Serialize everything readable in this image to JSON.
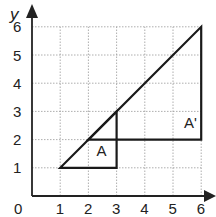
{
  "chart_data": {
    "type": "diagram",
    "title": "",
    "xlabel": "x",
    "ylabel": "y",
    "xlim": [
      0,
      6
    ],
    "ylim": [
      0,
      6
    ],
    "origin_label": "0",
    "x_ticks": [
      "1",
      "2",
      "3",
      "4",
      "5",
      "6"
    ],
    "y_ticks": [
      "1",
      "2",
      "3",
      "4",
      "5",
      "6"
    ],
    "grid": true,
    "shapes": [
      {
        "name": "A",
        "label": "A",
        "vertices": [
          [
            1,
            1
          ],
          [
            3,
            1
          ],
          [
            3,
            3
          ]
        ],
        "label_pos": [
          2.5,
          1.6
        ]
      },
      {
        "name": "A'",
        "label": "A'",
        "vertices": [
          [
            2,
            2
          ],
          [
            6,
            2
          ],
          [
            6,
            6
          ]
        ],
        "label_pos": [
          5.6,
          2.6
        ]
      }
    ]
  },
  "labels": {
    "A": "A",
    "A_prime": "A'",
    "x": "x",
    "y": "y",
    "origin": "0"
  }
}
